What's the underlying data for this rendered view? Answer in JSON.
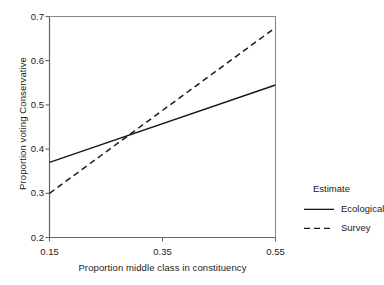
{
  "chart_data": {
    "type": "line",
    "title": "",
    "xlabel": "Proportion middle class in constituency",
    "ylabel": "Proportion voting Conservative",
    "xlim": [
      0.15,
      0.55
    ],
    "ylim": [
      0.2,
      0.7
    ],
    "xticks": [
      "0.15",
      "0.35",
      "0.55"
    ],
    "xtick_values": [
      0.15,
      0.35,
      0.55
    ],
    "yticks": [
      "0.2",
      "0.3",
      "0.4",
      "0.5",
      "0.6",
      "0.7"
    ],
    "ytick_values": [
      0.2,
      0.3,
      0.4,
      0.5,
      0.6,
      0.7
    ],
    "grid": false,
    "legend_position": "right",
    "legend_title": "Estimate",
    "series": [
      {
        "name": "Ecological",
        "style": "solid",
        "color": "#1a1a1a",
        "x": [
          0.15,
          0.55
        ],
        "values": [
          0.37,
          0.545
        ]
      },
      {
        "name": "Survey",
        "style": "dashed",
        "color": "#1a1a1a",
        "x": [
          0.15,
          0.55
        ],
        "values": [
          0.3,
          0.675
        ]
      }
    ],
    "annotations": [
      {
        "text": "lines intersect",
        "x": 0.3,
        "y": 0.425
      }
    ]
  },
  "legend": {
    "title": "Estimate",
    "items": [
      {
        "label": "Ecological",
        "style": "solid"
      },
      {
        "label": "Survey",
        "style": "dashed"
      }
    ]
  },
  "axes": {
    "x_label": "Proportion middle class in constituency",
    "y_label": "Proportion voting Conservative",
    "x_ticks": [
      "0.15",
      "0.35",
      "0.55"
    ],
    "y_ticks": [
      "0.2",
      "0.3",
      "0.4",
      "0.5",
      "0.6",
      "0.7"
    ]
  }
}
